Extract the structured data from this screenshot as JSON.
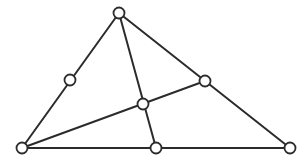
{
  "diagram": {
    "stroke_color": "#2b2b2b",
    "node_fill": "#ffffff",
    "node_radius": 5.5,
    "points": {
      "A": {
        "x": 119,
        "y": 13,
        "role": "top-vertex"
      },
      "B": {
        "x": 22,
        "y": 148,
        "role": "bottom-left-vertex"
      },
      "C": {
        "x": 290,
        "y": 148,
        "role": "bottom-right-vertex"
      },
      "M_AB": {
        "x": 70,
        "y": 80,
        "role": "midpoint-left-side"
      },
      "M_AC": {
        "x": 205,
        "y": 81,
        "role": "midpoint-right-side"
      },
      "M_BC": {
        "x": 156,
        "y": 148,
        "role": "midpoint-base"
      },
      "G": {
        "x": 143,
        "y": 104,
        "role": "centroid"
      }
    },
    "edges": [
      [
        "A",
        "B"
      ],
      [
        "A",
        "C"
      ],
      [
        "B",
        "C"
      ],
      [
        "A",
        "M_BC"
      ],
      [
        "B",
        "M_AC"
      ]
    ]
  }
}
